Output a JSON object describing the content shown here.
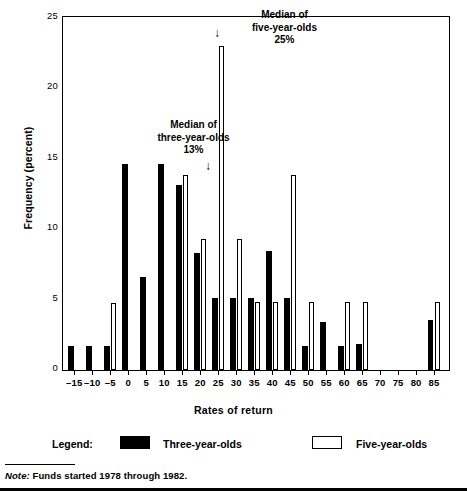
{
  "chart_data": {
    "type": "bar",
    "title": "",
    "xlabel": "Rates of return",
    "ylabel": "Frequency (percent)",
    "ylim": [
      0,
      25
    ],
    "ytick_values": [
      0,
      5,
      10,
      15,
      20,
      25
    ],
    "xtick_values": [
      -15,
      -10,
      -5,
      0,
      5,
      10,
      15,
      20,
      25,
      30,
      35,
      40,
      45,
      50,
      55,
      60,
      65,
      70,
      75,
      80,
      85
    ],
    "xtick_labels": [
      "–15",
      "–10",
      "–5",
      "0",
      "5",
      "10",
      "15",
      "20",
      "25",
      "30",
      "35",
      "40",
      "45",
      "50",
      "55",
      "60",
      "65",
      "70",
      "75",
      "80",
      "85"
    ],
    "xlim": [
      -18,
      89
    ],
    "grid": false,
    "legend_position": "below-axes",
    "categories": [
      -15,
      -10,
      -5,
      0,
      5,
      10,
      15,
      20,
      25,
      30,
      35,
      40,
      45,
      50,
      55,
      60,
      65,
      70,
      75,
      80,
      85
    ],
    "series": [
      {
        "name": "Three-year-olds",
        "color": "#000000",
        "style": "filled",
        "values": [
          1.7,
          1.7,
          1.7,
          14.6,
          6.6,
          14.6,
          13.1,
          8.3,
          5.1,
          5.1,
          5.1,
          8.4,
          5.1,
          1.7,
          3.4,
          1.7,
          1.8,
          0.0,
          0.0,
          0.0,
          3.5
        ]
      },
      {
        "name": "Five-year-olds",
        "color": "#ffffff",
        "style": "outlined",
        "values": [
          0.0,
          0.0,
          4.7,
          0.0,
          0.0,
          0.0,
          13.8,
          9.3,
          23.0,
          9.3,
          4.8,
          4.8,
          13.8,
          4.8,
          0.0,
          4.8,
          4.8,
          0.0,
          0.0,
          0.0,
          4.8
        ]
      }
    ],
    "annotations": [
      {
        "id": "median-three",
        "lines": [
          "Median of",
          "three-year-olds",
          "13%"
        ],
        "arrow": "↓",
        "points_to_x": 15,
        "value": "13%"
      },
      {
        "id": "median-five",
        "lines": [
          "Median of",
          "five-year-olds",
          "25%"
        ],
        "arrow": "↓",
        "points_to_x": 25,
        "value": "25%"
      }
    ]
  },
  "legend": {
    "title": "Legend:",
    "entries": [
      {
        "label": "Three-year-olds",
        "swatch": "filled-black-square"
      },
      {
        "label": "Five-year-olds",
        "swatch": "outlined-white-square"
      }
    ]
  },
  "note": {
    "prefix": "Note:",
    "text": " Funds started 1978 through 1982."
  }
}
